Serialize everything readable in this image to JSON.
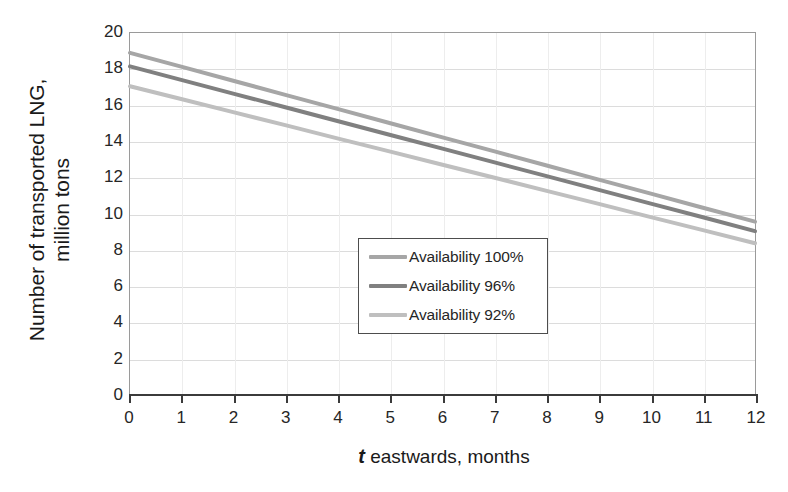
{
  "chart_data": {
    "type": "line",
    "title": "",
    "xlabel": "t eastwards, months",
    "xlabel_var": "t",
    "xlabel_rest": " eastwards, months",
    "ylabel_line1": "Number of transported LNG,",
    "ylabel_line2": "million tons",
    "x": [
      0,
      1,
      2,
      3,
      4,
      5,
      6,
      7,
      8,
      9,
      10,
      11,
      12
    ],
    "xlim": [
      0,
      12
    ],
    "ylim": [
      0,
      20
    ],
    "xticks": [
      "0",
      "1",
      "2",
      "3",
      "4",
      "5",
      "6",
      "7",
      "8",
      "9",
      "10",
      "11",
      "12"
    ],
    "yticks": [
      "0",
      "2",
      "4",
      "6",
      "8",
      "10",
      "12",
      "14",
      "16",
      "18",
      "20"
    ],
    "grid": "both",
    "legend_position": "center-left-inside",
    "series": [
      {
        "name": "Availability 100%",
        "color": "#a6a6a6",
        "values": [
          18.9,
          18.12,
          17.34,
          16.56,
          15.78,
          15.0,
          14.22,
          13.44,
          12.66,
          11.88,
          11.1,
          10.32,
          9.55
        ]
      },
      {
        "name": "Availability 96%",
        "color": "#808080",
        "values": [
          18.15,
          17.39,
          16.63,
          15.87,
          15.11,
          14.35,
          13.59,
          12.83,
          12.07,
          11.31,
          10.55,
          9.79,
          9.02
        ]
      },
      {
        "name": "Availability 92%",
        "color": "#bfbfbf",
        "values": [
          17.05,
          16.33,
          15.6,
          14.88,
          14.15,
          13.43,
          12.7,
          11.98,
          11.25,
          10.53,
          9.8,
          9.08,
          8.35
        ]
      }
    ]
  },
  "legend": {
    "items": [
      {
        "label": "Availability 100%",
        "color": "#a6a6a6"
      },
      {
        "label": "Availability 96%",
        "color": "#808080"
      },
      {
        "label": "Availability 92%",
        "color": "#bfbfbf"
      }
    ]
  },
  "colors": {
    "plot_border": "#9a9a9a",
    "axis_line": "#3b3b3b",
    "gridline_h": "#dcdcdc",
    "gridline_v": "#ededed",
    "text": "#262626",
    "legend_border": "#4d4d4d",
    "background": "#ffffff"
  }
}
